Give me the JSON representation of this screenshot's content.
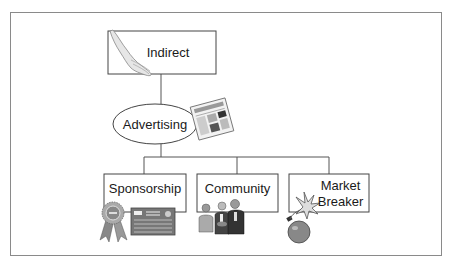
{
  "diagram": {
    "root": {
      "label": "Indirect",
      "icon": "hand-icon"
    },
    "middle": {
      "label": "Advertising",
      "icon": "newspaper-icon"
    },
    "children": [
      {
        "label": "Sponsorship",
        "icon": "ribbon-certificate-icon"
      },
      {
        "label": "Community",
        "icon": "people-handshake-icon"
      },
      {
        "label": "Market\nBreaker",
        "line1": "Market",
        "line2": "Breaker",
        "icon": "bomb-icon"
      }
    ]
  }
}
